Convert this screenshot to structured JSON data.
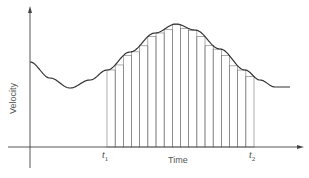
{
  "diagram": {
    "type": "riemann-sum-velocity-time",
    "y_axis_label": "Velocity",
    "x_axis_label": "Time",
    "marks": {
      "t1": {
        "base": "t",
        "sub": "1"
      },
      "t2": {
        "base": "t",
        "sub": "2"
      }
    },
    "rectangles_count": 18,
    "colors": {
      "line": "#333333",
      "rect": "#777777",
      "text": "#555555"
    }
  }
}
